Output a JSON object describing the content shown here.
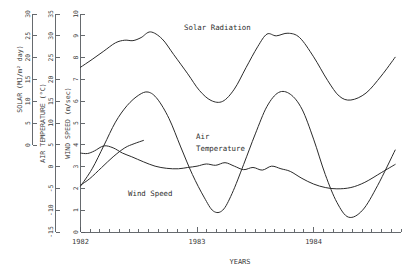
{
  "chart_data": {
    "type": "line",
    "title": "",
    "xlabel": "YEARS",
    "grid": false,
    "legend_position": "inline-labels",
    "x_axis": {
      "label": "YEARS",
      "tick_labels": [
        "1982",
        "1983",
        "1984"
      ],
      "tick_values": [
        1982,
        1983,
        1984
      ],
      "minor_ticks_per_major": 12,
      "range": [
        1982.0,
        1984.75
      ]
    },
    "y_axes": [
      {
        "name": "solar",
        "title": "SOLAR  (MJ/m² day)",
        "units": "MJ/m² day",
        "tick_labels": [
          "0",
          "5",
          "10",
          "15",
          "20",
          "25",
          "30"
        ],
        "tick_values": [
          0,
          5,
          10,
          15,
          20,
          25,
          30
        ],
        "range": [
          0,
          30
        ]
      },
      {
        "name": "air_temperature",
        "title": "AIR TEMPERATURE  (°C)",
        "units": "°C",
        "tick_labels": [
          "-15",
          "-10",
          "-5",
          "0",
          "5",
          "10",
          "15",
          "20",
          "25",
          "30",
          "35"
        ],
        "tick_values": [
          -15,
          -10,
          -5,
          0,
          5,
          10,
          15,
          20,
          25,
          30,
          35
        ],
        "range": [
          -15,
          35
        ]
      },
      {
        "name": "wind_speed",
        "title": "WIND SPEED  (m/sec)",
        "units": "m/sec",
        "tick_labels": [
          "0",
          "1",
          "2",
          "3",
          "4",
          "5",
          "6",
          "7",
          "8",
          "9",
          "10"
        ],
        "tick_values": [
          0,
          1,
          2,
          3,
          4,
          5,
          6,
          7,
          8,
          9,
          10
        ],
        "range": [
          0,
          10
        ]
      }
    ],
    "series": [
      {
        "name": "Solar Radiation",
        "axis": "solar",
        "label": "Solar Radiation",
        "x": [
          1982.0,
          1982.1,
          1982.2,
          1982.3,
          1982.38,
          1982.45,
          1982.52,
          1982.6,
          1982.7,
          1982.8,
          1982.92,
          1983.02,
          1983.12,
          1983.22,
          1983.32,
          1983.42,
          1983.52,
          1983.6,
          1983.68,
          1983.78,
          1983.88,
          1984.0,
          1984.12,
          1984.22,
          1984.32,
          1984.45,
          1984.58,
          1984.7
        ],
        "y": [
          17.8,
          19.6,
          21.5,
          23.4,
          24.0,
          23.9,
          24.6,
          25.9,
          24.3,
          20.7,
          16.3,
          12.5,
          10.2,
          10.0,
          12.8,
          17.7,
          22.5,
          25.4,
          25.0,
          25.6,
          24.6,
          20.2,
          14.8,
          11.2,
          10.3,
          11.9,
          15.8,
          20.1
        ]
      },
      {
        "name": "Air Temperature",
        "axis": "air_temperature",
        "label": "Air Temperature",
        "x": [
          1982.0,
          1982.1,
          1982.2,
          1982.3,
          1982.4,
          1982.5,
          1982.58,
          1982.66,
          1982.76,
          1982.86,
          1982.96,
          1983.06,
          1983.14,
          1983.22,
          1983.3,
          1983.4,
          1983.5,
          1983.6,
          1983.7,
          1983.8,
          1983.9,
          1984.0,
          1984.1,
          1984.2,
          1984.3,
          1984.42,
          1984.55,
          1984.7
        ],
        "y": [
          -4.5,
          -0.5,
          4.8,
          10.2,
          14.0,
          16.4,
          17.1,
          15.5,
          11.0,
          4.5,
          -1.8,
          -7.0,
          -10.2,
          -10.0,
          -6.2,
          0.5,
          7.5,
          13.8,
          17.0,
          16.6,
          13.2,
          6.3,
          -1.8,
          -8.2,
          -11.6,
          -10.0,
          -4.3,
          3.8
        ]
      },
      {
        "name": "Wind Speed",
        "axis": "wind_speed",
        "label": "Wind Speed",
        "x": [
          1982.0,
          1982.06,
          1982.12,
          1982.2,
          1982.28,
          1982.36,
          1982.44,
          1982.54,
          1982.64,
          1982.74,
          1982.84,
          1982.92,
          1983.0,
          1983.08,
          1983.16,
          1983.24,
          1983.32,
          1983.4,
          1983.48,
          1983.56,
          1983.64,
          1983.72,
          1983.8,
          1983.9,
          1984.0,
          1984.1,
          1984.2,
          1984.32,
          1984.44,
          1984.58,
          1984.7
        ],
        "y": [
          3.62,
          3.6,
          3.72,
          3.95,
          3.86,
          3.62,
          3.45,
          3.22,
          3.02,
          2.92,
          2.9,
          2.96,
          3.02,
          3.12,
          3.06,
          3.18,
          3.02,
          2.86,
          2.96,
          2.84,
          3.02,
          2.9,
          2.78,
          2.46,
          2.2,
          2.04,
          1.98,
          2.04,
          2.28,
          2.72,
          3.1
        ]
      },
      {
        "name": "Wind Speed Lower Branch",
        "axis": "wind_speed",
        "label": "",
        "x": [
          1982.0,
          1982.08,
          1982.18,
          1982.28,
          1982.38,
          1982.46,
          1982.54
        ],
        "y": [
          2.15,
          2.45,
          2.95,
          3.45,
          3.86,
          4.05,
          4.2
        ]
      }
    ],
    "annotations": [
      {
        "text": "Solar Radiation",
        "x": 1983.1,
        "y_frac": 0.88
      },
      {
        "text": "Air Temperature",
        "x": 1983.0,
        "y_frac": 0.48
      },
      {
        "text": "Wind Speed",
        "x": 1982.6,
        "y_frac": 0.29
      }
    ]
  },
  "labels": {
    "solar_axis_title": "SOLAR  (MJ/m² day)",
    "temp_axis_title": "AIR TEMPERATURE  (°C)",
    "wind_axis_title": "WIND SPEED  (m/sec)",
    "x_axis_title": "YEARS",
    "solar_curve": "Solar Radiation",
    "temp_curve_line1": "Air",
    "temp_curve_line2": "Temperature",
    "wind_curve": "Wind Speed",
    "year_1": "1982",
    "year_2": "1983",
    "year_3": "1984"
  },
  "solar_ticks": [
    "0",
    "5",
    "10",
    "15",
    "20",
    "25",
    "30"
  ],
  "temp_ticks": [
    "-15",
    "-10",
    "-5",
    "0",
    "5",
    "10",
    "15",
    "20",
    "25",
    "30",
    "35"
  ],
  "wind_ticks": [
    "0",
    "1",
    "2",
    "3",
    "4",
    "5",
    "6",
    "7",
    "8",
    "9",
    "10"
  ],
  "colors": {
    "curve": "#2b2b2b",
    "axis": "#555a5e",
    "text": "#3a3a3a",
    "background": "#ffffff"
  }
}
